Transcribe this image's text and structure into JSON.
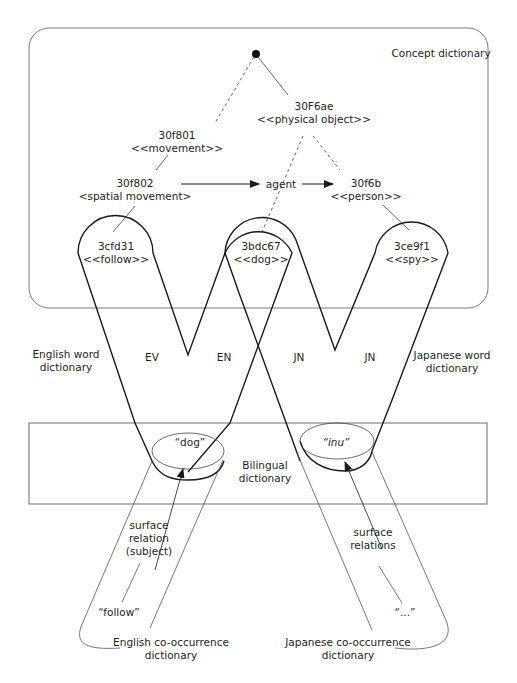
{
  "diagram": {
    "colors": {
      "line": "#1a1a1a",
      "box": "#6e6e6e",
      "thin": "#555555",
      "background": "#ffffff"
    },
    "regions": {
      "concept_dictionary": "Concept dictionary",
      "english_word_dictionary": [
        "English word",
        "dictionary"
      ],
      "japanese_word_dictionary": [
        "Japanese word",
        "dictionary"
      ],
      "bilingual_dictionary": [
        "Bilingual",
        "dictionary"
      ],
      "english_cooccurrence_dictionary": [
        "English co-occurrence",
        "dictionary"
      ],
      "japanese_cooccurrence_dictionary": [
        "Japanese co-occurrence",
        "dictionary"
      ]
    },
    "concepts": [
      {
        "id": "30F6ae",
        "label": "<<physical object>>"
      },
      {
        "id": "30f801",
        "label": "<<movement>>"
      },
      {
        "id": "30f802",
        "label": "<spatial movement>"
      },
      {
        "id": "30f6b",
        "label": "<<person>>"
      },
      {
        "id": "3cfd31",
        "label": "<<follow>>"
      },
      {
        "id": "3bdc67",
        "label": "<<dog>>"
      },
      {
        "id": "3ce9f1",
        "label": "<<spy>>"
      }
    ],
    "relation": "agent",
    "loop_labels": [
      "EV",
      "EN",
      "JN",
      "JN"
    ],
    "words": {
      "english": "“dog”",
      "japanese": "“inu”",
      "english_cooc": "“follow”",
      "japanese_cooc": "“...”"
    },
    "surface_relation_en": [
      "surface",
      "relation",
      "(subject)"
    ],
    "surface_relation_jp": [
      "surface",
      "relations"
    ]
  }
}
